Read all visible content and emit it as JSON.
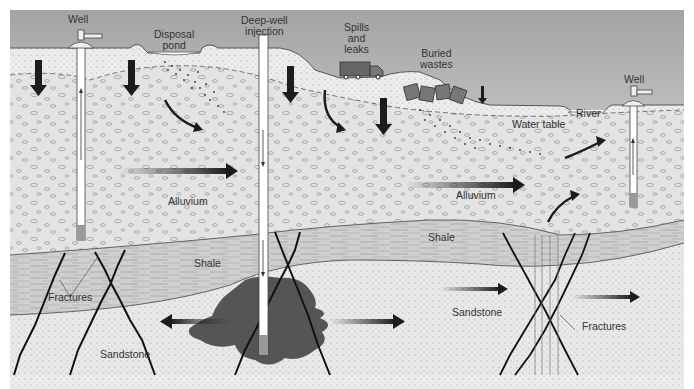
{
  "diagram": {
    "colors": {
      "sky": "#a9a9a9",
      "topsoil": "#ececec",
      "alluvium": "#e3e3e3",
      "shale": "#cfcfcf",
      "sandstone": "#e8e8e8",
      "plume": "#555555",
      "arrow": "#1c1c1c",
      "well": "#ffffff"
    },
    "labels": {
      "well_left": "Well",
      "disposal_pond_1": "Disposal",
      "disposal_pond_2": "pond",
      "deep_well_1": "Deep-well",
      "deep_well_2": "injection",
      "spills_1": "Spills",
      "spills_2": "and",
      "spills_3": "leaks",
      "buried_1": "Buried",
      "buried_2": "wastes",
      "river": "River",
      "well_right": "Well",
      "water_table": "Water table",
      "alluvium_left": "Alluvium",
      "alluvium_right": "Alluvium",
      "shale_left": "Shale",
      "shale_right": "Shale",
      "fractures_left": "Fractures",
      "fractures_right": "Fractures",
      "sandstone_left": "Sandstone",
      "sandstone_right": "Sandstone"
    },
    "layers": [
      "Sky",
      "Topsoil",
      "Alluvium",
      "Shale",
      "Sandstone"
    ],
    "icons": [
      "well-icon",
      "truck-icon",
      "waste-barrel-icon",
      "flow-arrow-icon",
      "fracture-icon",
      "plume-icon"
    ]
  }
}
